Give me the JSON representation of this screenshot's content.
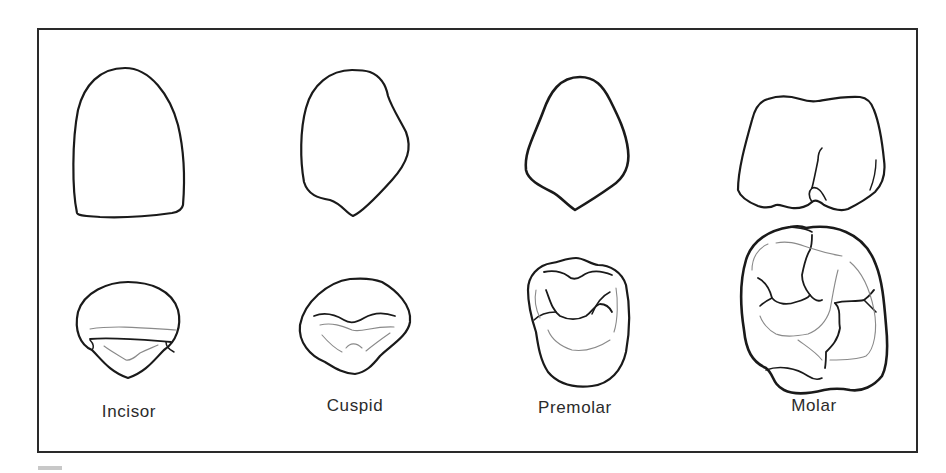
{
  "figure": {
    "colors": {
      "outline": "#1a1a1a",
      "detail": "#8a8a8a",
      "frame": "#2a2a2a",
      "label": "#2b2b2b"
    },
    "teeth": [
      {
        "id": "incisor",
        "label": "Incisor"
      },
      {
        "id": "cuspid",
        "label": "Cuspid"
      },
      {
        "id": "premolar",
        "label": "Premolar"
      },
      {
        "id": "molar",
        "label": "Molar"
      }
    ]
  }
}
